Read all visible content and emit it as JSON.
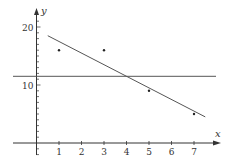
{
  "chart_data": {
    "type": "scatter",
    "title": "",
    "xlabel": "x",
    "ylabel": "y",
    "xlim": [
      -1,
      8
    ],
    "ylim": [
      -2,
      23
    ],
    "grid": false,
    "x_ticks": [
      1,
      2,
      3,
      4,
      5,
      6,
      7
    ],
    "y_tick_labels": [
      10,
      20
    ],
    "y_minor_tick_step": 1,
    "series": [
      {
        "name": "data points",
        "type": "scatter",
        "points": [
          [
            1,
            16
          ],
          [
            3,
            16
          ],
          [
            5,
            9
          ],
          [
            7,
            5
          ]
        ]
      },
      {
        "name": "regression line",
        "type": "line",
        "equation": "y = 19.5 - 2x",
        "points": [
          [
            0.5,
            18.5
          ],
          [
            7.5,
            4.5
          ]
        ]
      },
      {
        "name": "mean line",
        "type": "line",
        "equation": "y = 11.5",
        "points": [
          [
            -1,
            11.5
          ],
          [
            8,
            11.5
          ]
        ]
      }
    ]
  },
  "colors": {
    "axis": "#333333",
    "line": "#555555",
    "point": "#222222",
    "background": "#ffffff"
  }
}
